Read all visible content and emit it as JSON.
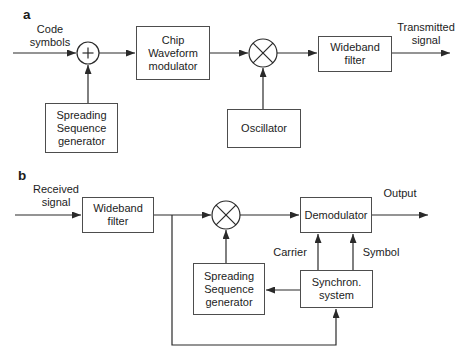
{
  "figure": {
    "type": "block-diagram",
    "colors": {
      "background": "#ffffff",
      "line": "#2a2a2a",
      "box_border": "#4d4d4d",
      "text": "#1c1c1c"
    },
    "icons": {
      "adder": "plus-in-circle",
      "multiplier": "x-in-circle",
      "arrowhead": "solid-triangle"
    }
  },
  "panel_a": {
    "label": "a",
    "source_label": "Code\nsymbols",
    "adder_symbol": "+",
    "multiplier_symbol": "×",
    "boxes": {
      "chip_modulator": "Chip\nWaveform\nmodulator",
      "wideband_filter": "Wideband\nfilter",
      "spreading_generator": "Spreading\nSequence\ngenerator",
      "oscillator": "Oscillator"
    },
    "output_label": "Transmitted\nsignal"
  },
  "panel_b": {
    "label": "b",
    "source_label": "Received\nsignal",
    "multiplier_symbol": "×",
    "boxes": {
      "wideband_filter": "Wideband\nfilter",
      "demodulator": "Demodulator",
      "spreading_generator": "Spreading\nSequence\ngenerator",
      "synchron_system": "Synchron.\nsystem"
    },
    "signal_labels": {
      "carrier": "Carrier",
      "symbol": "Symbol"
    },
    "output_label": "Output"
  }
}
